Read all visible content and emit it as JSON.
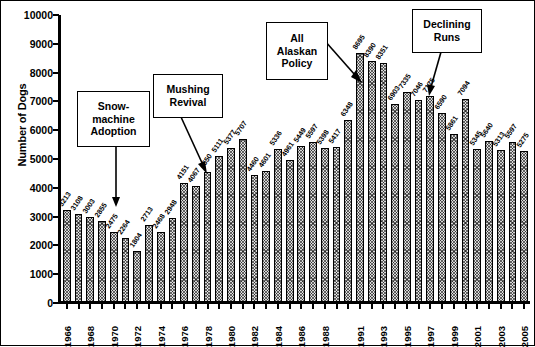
{
  "chart_data": {
    "type": "bar",
    "title": "",
    "xlabel": "",
    "ylabel": "Number of Dogs",
    "ylim": [
      0,
      10000
    ],
    "ytick_values": [
      0,
      1000,
      2000,
      3000,
      4000,
      5000,
      6000,
      7000,
      8000,
      9000,
      10000
    ],
    "ytick_labels": [
      "0",
      "1000",
      "2000",
      "3000",
      "4000",
      "5000",
      "6000",
      "7000",
      "8000",
      "9000",
      "10000"
    ],
    "grid": false,
    "legend": "none",
    "bar_fill_color": "#d9d9d9",
    "bar_edge_color": "#000000",
    "categories": [
      "1966",
      "1967",
      "1968",
      "1969",
      "1970",
      "1971",
      "1972",
      "1973",
      "1974",
      "1975",
      "1976",
      "1977",
      "1978",
      "1979",
      "1980",
      "1981",
      "1982",
      "1983",
      "1984",
      "1985",
      "1986",
      "1987",
      "1988",
      "1989",
      "1990",
      "1991",
      "1992",
      "1993",
      "1994",
      "1995",
      "1996",
      "1997",
      "1998",
      "1999",
      "2000",
      "2001",
      "2002",
      "2003",
      "2004",
      "2005"
    ],
    "values": [
      3213,
      3108,
      3003,
      2855,
      2475,
      2264,
      1804,
      2713,
      2468,
      2948,
      4151,
      4067,
      4550,
      5111,
      5377,
      5707,
      4460,
      4601,
      5336,
      4961,
      5449,
      5597,
      5398,
      5417,
      6348,
      8695,
      8390,
      8351,
      6903,
      7335,
      7046,
      7175,
      6590,
      5861,
      7094,
      5345,
      5640,
      5313,
      5597,
      5275
    ],
    "xtick_labels_shown": [
      "1966",
      "1968",
      "1970",
      "1972",
      "1974",
      "1976",
      "1978",
      "1980",
      "1982",
      "1984",
      "1986",
      "1988",
      "1991",
      "1993",
      "1995",
      "1997",
      "1999",
      "2001",
      "2003",
      "2005"
    ],
    "annotations": [
      {
        "id": "snow-machine-adoption",
        "text": "Snow-machine Adoption",
        "lines": [
          "Snow-",
          "machine",
          "Adoption"
        ],
        "points_to_year": "1972"
      },
      {
        "id": "mushing-revival",
        "text": "Mushing Revival",
        "lines": [
          "Mushing",
          "Revival"
        ],
        "points_to_year": "1976"
      },
      {
        "id": "all-alaskan-policy",
        "text": "All Alaskan Policy",
        "lines": [
          "All",
          "Alaskan",
          "Policy"
        ],
        "points_to_year": "1991"
      },
      {
        "id": "declining-runs",
        "text": "Declining Runs",
        "lines": [
          "Declining",
          "Runs"
        ],
        "points_to_year": "1998"
      }
    ]
  }
}
